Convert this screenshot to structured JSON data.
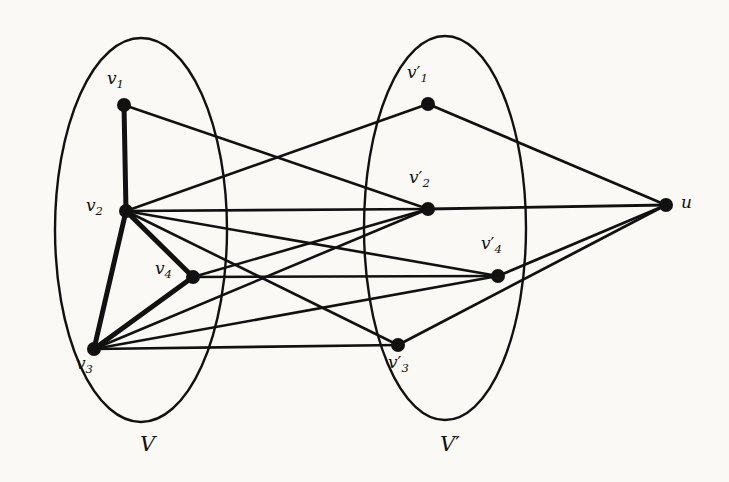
{
  "figure": {
    "background_color": "#faf9f6",
    "ink_color": "#111111",
    "type": "graph-diagram"
  },
  "groups": [
    {
      "id": "V",
      "label": "V",
      "label_x": 140,
      "label_y": 432,
      "ellipse": {
        "cx": 141,
        "cy": 230,
        "rx": 86,
        "ry": 192
      }
    },
    {
      "id": "Vprime",
      "label": "V",
      "label_prime": "′",
      "label_x": 440,
      "label_y": 432,
      "ellipse": {
        "cx": 445,
        "cy": 228,
        "rx": 81,
        "ry": 192
      }
    }
  ],
  "nodes": [
    {
      "id": "v1",
      "base": "v",
      "sub": "1",
      "prime": "",
      "x": 124,
      "y": 105,
      "label_x": 107,
      "label_y": 68,
      "r": 7
    },
    {
      "id": "v2",
      "base": "v",
      "sub": "2",
      "prime": "",
      "x": 126,
      "y": 211,
      "label_x": 86,
      "label_y": 195,
      "r": 7
    },
    {
      "id": "v3",
      "base": "v",
      "sub": "3",
      "prime": "",
      "x": 94,
      "y": 349,
      "label_x": 76,
      "label_y": 353,
      "r": 7
    },
    {
      "id": "v4",
      "base": "v",
      "sub": "4",
      "prime": "",
      "x": 193,
      "y": 277,
      "label_x": 155,
      "label_y": 258,
      "r": 7
    },
    {
      "id": "vp1",
      "base": "v",
      "sub": "1",
      "prime": "′",
      "x": 428,
      "y": 104,
      "label_x": 407,
      "label_y": 62,
      "r": 7
    },
    {
      "id": "vp2",
      "base": "v",
      "sub": "2",
      "prime": "′",
      "x": 428,
      "y": 209,
      "label_x": 409,
      "label_y": 167,
      "r": 7
    },
    {
      "id": "vp3",
      "base": "v",
      "sub": "3",
      "prime": "′",
      "x": 398,
      "y": 345,
      "label_x": 388,
      "label_y": 352,
      "r": 7
    },
    {
      "id": "vp4",
      "base": "v",
      "sub": "4",
      "prime": "′",
      "x": 498,
      "y": 276,
      "label_x": 481,
      "label_y": 233,
      "r": 7
    },
    {
      "id": "u",
      "base": "u",
      "sub": "",
      "prime": "",
      "x": 666,
      "y": 205,
      "label_x": 681,
      "label_y": 192,
      "r": 7
    }
  ],
  "edges": [
    {
      "from": "v1",
      "to": "v2",
      "weight": "thick",
      "width": 5.0
    },
    {
      "from": "v2",
      "to": "v4",
      "weight": "thick",
      "width": 5.0
    },
    {
      "from": "v2",
      "to": "v3",
      "weight": "thick",
      "width": 5.0
    },
    {
      "from": "v3",
      "to": "v4",
      "weight": "thick",
      "width": 5.0
    },
    {
      "from": "v1",
      "to": "vp2",
      "weight": "thin",
      "width": 2.6
    },
    {
      "from": "v2",
      "to": "vp1",
      "weight": "thin",
      "width": 2.6
    },
    {
      "from": "v2",
      "to": "vp2",
      "weight": "thin",
      "width": 2.6
    },
    {
      "from": "v2",
      "to": "vp4",
      "weight": "thin",
      "width": 2.6
    },
    {
      "from": "v2",
      "to": "vp3",
      "weight": "thin",
      "width": 2.6
    },
    {
      "from": "v4",
      "to": "vp2",
      "weight": "thin",
      "width": 2.6
    },
    {
      "from": "v4",
      "to": "vp4",
      "weight": "thin",
      "width": 2.6
    },
    {
      "from": "v3",
      "to": "vp2",
      "weight": "thin",
      "width": 2.6
    },
    {
      "from": "v3",
      "to": "vp4",
      "weight": "thin",
      "width": 2.6
    },
    {
      "from": "v3",
      "to": "vp3",
      "weight": "thin",
      "width": 2.6
    },
    {
      "from": "vp1",
      "to": "u",
      "weight": "thin",
      "width": 2.8
    },
    {
      "from": "vp2",
      "to": "u",
      "weight": "thin",
      "width": 2.8
    },
    {
      "from": "vp4",
      "to": "u",
      "weight": "thin",
      "width": 2.8
    },
    {
      "from": "vp3",
      "to": "u",
      "weight": "thin",
      "width": 2.8
    }
  ]
}
